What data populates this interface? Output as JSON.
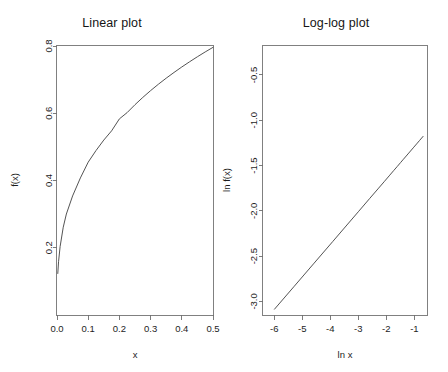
{
  "figure": {
    "width": 448,
    "height": 372,
    "background": "#ffffff",
    "line_color": "#4a4a4a",
    "axis_color": "#6e6e6e",
    "text_color": "#1d1d1d"
  },
  "chart_data": [
    {
      "type": "line",
      "panel": "left",
      "title": "Linear plot",
      "xlabel": "x",
      "ylabel": "f(x)",
      "xlim": [
        0.0,
        0.5
      ],
      "ylim": [
        0.0,
        0.8
      ],
      "grid": false,
      "legend": "none",
      "xticks": [
        0.0,
        0.1,
        0.2,
        0.3,
        0.4,
        0.5
      ],
      "xticklabels": [
        "0.0",
        "0.1",
        "0.2",
        "0.3",
        "0.4",
        "0.5"
      ],
      "yticks": [
        0.2,
        0.4,
        0.6,
        0.8
      ],
      "yticklabels": [
        "0.2",
        "0.4",
        "0.6",
        "0.8"
      ],
      "relation": "power law f(x) = x^0.36",
      "x": [
        0.0025,
        0.005,
        0.01,
        0.02,
        0.03,
        0.05,
        0.075,
        0.1,
        0.125,
        0.15,
        0.175,
        0.2,
        0.225,
        0.25,
        0.275,
        0.3,
        0.325,
        0.35,
        0.375,
        0.4,
        0.425,
        0.45,
        0.475,
        0.5
      ],
      "y": [
        0.1235,
        0.1585,
        0.2035,
        0.2611,
        0.3003,
        0.3541,
        0.4077,
        0.4545,
        0.4891,
        0.5203,
        0.5477,
        0.5833,
        0.6021,
        0.6255,
        0.6471,
        0.6673,
        0.6863,
        0.7043,
        0.7213,
        0.7376,
        0.7531,
        0.768,
        0.7823,
        0.796
      ]
    },
    {
      "type": "line",
      "panel": "right",
      "title": "Log-log plot",
      "xlabel": "ln x",
      "ylabel": "ln f(x)",
      "xlim": [
        -6.4,
        -0.55
      ],
      "ylim": [
        -3.15,
        -0.18
      ],
      "grid": false,
      "legend": "none",
      "xticks": [
        -6,
        -5,
        -4,
        -3,
        -2,
        -1
      ],
      "xticklabels": [
        "-6",
        "-5",
        "-4",
        "-3",
        "-2",
        "-1"
      ],
      "yticks": [
        -0.5,
        -1.0,
        -1.5,
        -2.0,
        -2.5,
        -3.0
      ],
      "yticklabels": [
        "-0.5",
        "-1.0",
        "-1.5",
        "-2.0",
        "-2.5",
        "-3.0"
      ],
      "relation": "straight line, slope = 0.36, intercept = -0.93",
      "x": [
        -5.99,
        -5.3,
        -4.6,
        -3.91,
        -3.5,
        -3.0,
        -2.59,
        -2.3,
        -2.08,
        -1.9,
        -1.74,
        -1.61,
        -1.49,
        -1.39,
        -1.2,
        -1.02,
        -0.92,
        -0.82,
        -0.74,
        -0.69
      ],
      "y": [
        -3.086,
        -2.838,
        -2.586,
        -2.338,
        -2.19,
        -2.01,
        -1.862,
        -1.758,
        -1.679,
        -1.614,
        -1.556,
        -1.51,
        -1.466,
        -1.43,
        -1.362,
        -1.297,
        -1.261,
        -1.225,
        -1.196,
        -1.178
      ]
    }
  ]
}
